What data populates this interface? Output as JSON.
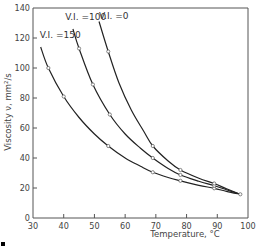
{
  "chart_data": {
    "type": "line",
    "title": "",
    "xlabel": "Temperature, °C",
    "ylabel": "Viscosity ν, mm²/s",
    "xlim": [
      30,
      100
    ],
    "ylim": [
      0,
      140
    ],
    "xticks": [
      30,
      40,
      50,
      60,
      70,
      80,
      90,
      100
    ],
    "yticks": [
      0,
      20,
      40,
      60,
      80,
      100,
      120,
      140
    ],
    "xtick_labels": [
      "30",
      "40",
      "50",
      "60",
      "70",
      "80",
      "90",
      "100"
    ],
    "ytick_labels": [
      "0",
      "20",
      "40",
      "60",
      "80",
      "100",
      "120",
      "140"
    ],
    "grid": false,
    "legend": "inline-labels",
    "series": [
      {
        "name": "V.I. = 150",
        "label": "V.I. =150",
        "curve": [
          [
            32.5,
            114
          ],
          [
            35,
            100
          ],
          [
            40,
            81
          ],
          [
            45,
            67
          ],
          [
            50,
            56
          ],
          [
            54.5,
            48
          ],
          [
            60,
            40
          ],
          [
            65,
            34.5
          ],
          [
            69,
            30.5
          ],
          [
            74,
            27
          ],
          [
            78,
            24.8
          ],
          [
            84,
            21.8
          ],
          [
            89,
            19.8
          ],
          [
            93,
            17.8
          ],
          [
            97.5,
            15.8
          ]
        ],
        "markers": [
          [
            35,
            100
          ],
          [
            40,
            81
          ],
          [
            54.5,
            48
          ],
          [
            69,
            30.5
          ],
          [
            78,
            24.8
          ],
          [
            89,
            19.8
          ],
          [
            97.5,
            15.8
          ]
        ]
      },
      {
        "name": "V.I. = 100",
        "label": "V.I. =100",
        "curve": [
          [
            43,
            126
          ],
          [
            45,
            113
          ],
          [
            49.5,
            89
          ],
          [
            55,
            69
          ],
          [
            60,
            56
          ],
          [
            65,
            46.5
          ],
          [
            69,
            40
          ],
          [
            74,
            33
          ],
          [
            78,
            28.7
          ],
          [
            84,
            24.5
          ],
          [
            89,
            21.5
          ],
          [
            93,
            18.8
          ],
          [
            97.5,
            15.8
          ]
        ],
        "markers": [
          [
            45,
            113
          ],
          [
            49.5,
            89
          ],
          [
            55,
            69
          ],
          [
            69,
            40
          ],
          [
            78,
            28.7
          ],
          [
            89,
            21.5
          ]
        ]
      },
      {
        "name": "V.I. = 0",
        "label": "V.I. =0",
        "curve": [
          [
            51.5,
            131
          ],
          [
            54.5,
            111
          ],
          [
            58,
            90
          ],
          [
            62,
            72
          ],
          [
            66,
            58
          ],
          [
            69,
            48
          ],
          [
            74,
            38
          ],
          [
            78,
            32
          ],
          [
            84,
            26.5
          ],
          [
            89,
            23
          ],
          [
            93,
            19.5
          ],
          [
            97.5,
            15.8
          ]
        ],
        "markers": [
          [
            54.5,
            111
          ],
          [
            69,
            48
          ],
          [
            78,
            32
          ],
          [
            89,
            23
          ]
        ]
      }
    ],
    "label_positions_data": [
      [
        32.2,
        120
      ],
      [
        40.5,
        132
      ],
      [
        51.5,
        133
      ]
    ]
  }
}
